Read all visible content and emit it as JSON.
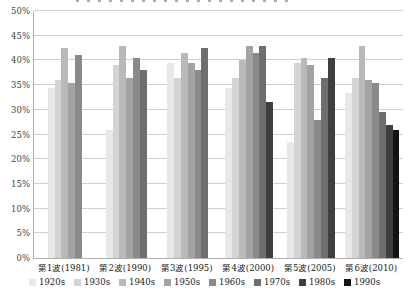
{
  "chart_data": {
    "type": "bar",
    "title": "",
    "xlabel": "",
    "ylabel": "",
    "ylim": [
      0,
      50
    ],
    "grid": true,
    "legend_position": "bottom",
    "y_ticks": [
      "0%",
      "5%",
      "10%",
      "15%",
      "20%",
      "25%",
      "30%",
      "35%",
      "40%",
      "45%",
      "50%"
    ],
    "y_tick_values": [
      0,
      5,
      10,
      15,
      20,
      25,
      30,
      35,
      40,
      45,
      50
    ],
    "categories": [
      "第1波(1981)",
      "第2波(1990)",
      "第3波(1995)",
      "第4波(2000)",
      "第5波(2005)",
      "第6波(2010)"
    ],
    "series": [
      {
        "name": "1920s",
        "color": "#e8e8e6",
        "values": [
          34.5,
          26,
          39.5,
          34.5,
          23.5,
          33.5
        ]
      },
      {
        "name": "1930s",
        "color": "#d3d3d1",
        "values": [
          36,
          39,
          36.5,
          36.5,
          39.5,
          36.5
        ]
      },
      {
        "name": "1940s",
        "color": "#b9b9b7",
        "values": [
          42.5,
          43,
          41.5,
          40,
          40.5,
          43
        ]
      },
      {
        "name": "1950s",
        "color": "#a3a3a1",
        "values": [
          35.5,
          36.5,
          39.5,
          43,
          39,
          36
        ]
      },
      {
        "name": "1960s",
        "color": "#8a8a88",
        "values": [
          41,
          40.5,
          38,
          41.5,
          28,
          35.5
        ]
      },
      {
        "name": "1970s",
        "color": "#6e6e6c",
        "values": [
          null,
          38,
          42.5,
          43,
          36.5,
          29.5
        ]
      },
      {
        "name": "1980s",
        "color": "#3f3f3d",
        "values": [
          null,
          null,
          null,
          31.5,
          40.5,
          27
        ]
      },
      {
        "name": "1990s",
        "color": "#141414",
        "values": [
          null,
          null,
          null,
          null,
          null,
          26
        ]
      }
    ]
  }
}
